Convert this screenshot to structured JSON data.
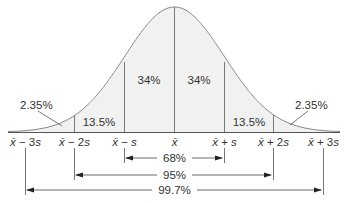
{
  "diagram": {
    "type": "normal-distribution-empirical-rule",
    "colors": {
      "curve": "#8a8a8a",
      "fill": "#f1f1f1",
      "lines": "#7a7a7a",
      "text": "#333333",
      "arrow": "#222222"
    },
    "regions": [
      {
        "id": "left-tail",
        "label": "2.35%"
      },
      {
        "id": "left-2s",
        "label": "13.5%"
      },
      {
        "id": "left-1s",
        "label": "34%"
      },
      {
        "id": "right-1s",
        "label": "34%"
      },
      {
        "id": "right-2s",
        "label": "13.5%"
      },
      {
        "id": "right-tail",
        "label": "2.35%"
      }
    ],
    "axis_ticks": [
      {
        "mean": "x̄",
        "op": "−",
        "mult": "3s"
      },
      {
        "mean": "x̄",
        "op": "−",
        "mult": "2s"
      },
      {
        "mean": "x̄",
        "op": "−",
        "mult": "s"
      },
      {
        "mean": "x̄",
        "op": "",
        "mult": ""
      },
      {
        "mean": "x̄",
        "op": "+",
        "mult": "s"
      },
      {
        "mean": "x̄",
        "op": "+",
        "mult": "2s"
      },
      {
        "mean": "x̄",
        "op": "+",
        "mult": "3s"
      }
    ],
    "ranges": [
      {
        "id": "within-1s",
        "label": "68%"
      },
      {
        "id": "within-2s",
        "label": "95%"
      },
      {
        "id": "within-3s",
        "label": "99.7%"
      }
    ]
  }
}
